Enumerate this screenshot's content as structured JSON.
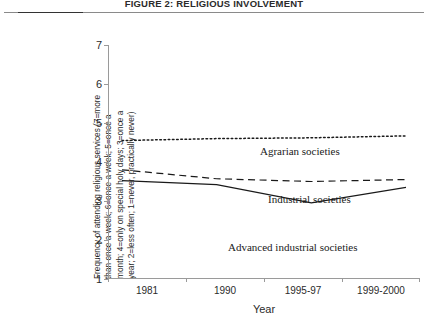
{
  "figure": {
    "title": "FIGURE 2: RELIGIOUS INVOLVEMENT"
  },
  "chart_data": {
    "type": "line",
    "title": "FIGURE 2: RELIGIOUS INVOLVEMENT",
    "xlabel": "Year",
    "ylabel": "Frequency of attending religious services (7=more than once a week; 6=once a week; 5=once a month; 4=only on special holy days; 3=once a year; 2=less often; 1=never, practically never)",
    "categories": [
      "1981",
      "1990",
      "1995-97",
      "1999-2000"
    ],
    "ylim": [
      1,
      7
    ],
    "yticks": [
      1,
      2,
      3,
      4,
      5,
      6,
      7
    ],
    "grid": false,
    "legend": "inline-annotations",
    "series": [
      {
        "name": "Agrarian societies",
        "style": "dotted",
        "color": "#1a1a1a",
        "values": [
          4.55,
          4.6,
          4.62,
          4.67
        ]
      },
      {
        "name": "Industrial societies",
        "style": "dashed",
        "color": "#1a1a1a",
        "values": [
          3.8,
          3.57,
          3.5,
          3.55
        ]
      },
      {
        "name": "Advanced industrial societies",
        "style": "solid",
        "color": "#1a1a1a",
        "values": [
          3.52,
          3.42,
          2.95,
          3.35
        ]
      }
    ],
    "annotations": [
      {
        "text": "Agrarian societies",
        "series": "Agrarian societies"
      },
      {
        "text": "Industrial societies",
        "series": "Industrial societies"
      },
      {
        "text": "Advanced industrial societies",
        "series": "Advanced industrial societies"
      }
    ]
  },
  "axes": {
    "y_tick_labels": [
      "7",
      "6",
      "5",
      "4",
      "3",
      "2",
      "1"
    ],
    "x_tick_labels": [
      "1981",
      "1990",
      "1995-97",
      "1999-2000"
    ],
    "x_axis_title": "Year",
    "y_axis_caption_lines": [
      "Frequency of attending religious services (7=more",
      "than once a week; 6=once a week; 5=once a",
      "month; 4=only on special holy days; 3=once a",
      "year; 2=less often; 1=never, practically never)"
    ]
  }
}
